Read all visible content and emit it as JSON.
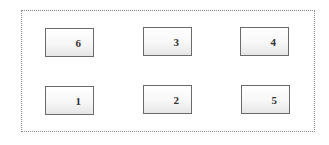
{
  "diagram": {
    "boxes": [
      {
        "id": "6",
        "label": "6",
        "row": 1,
        "col": 1
      },
      {
        "id": "3",
        "label": "3",
        "row": 1,
        "col": 2
      },
      {
        "id": "4",
        "label": "4",
        "row": 1,
        "col": 3
      },
      {
        "id": "1",
        "label": "1",
        "row": 2,
        "col": 1
      },
      {
        "id": "2",
        "label": "2",
        "row": 2,
        "col": 2
      },
      {
        "id": "5",
        "label": "5",
        "row": 2,
        "col": 3
      }
    ],
    "colors": {
      "frame_border": "#8a8a8a",
      "box_border": "#6a6a6a",
      "label": "#333333"
    }
  }
}
